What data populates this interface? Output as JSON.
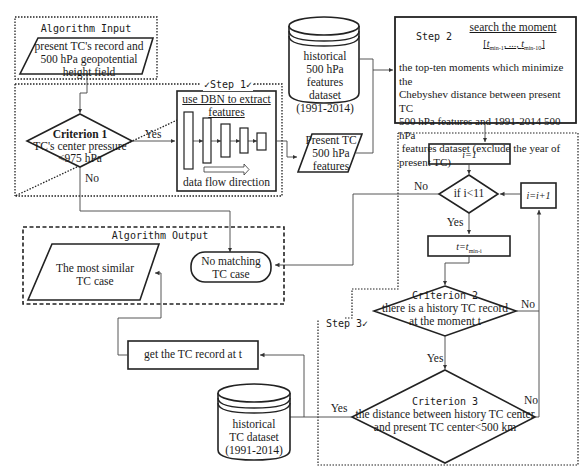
{
  "input_section": {
    "title": "Algorithm Input",
    "record": [
      "present TC's record and",
      "500 hPa geopotential",
      "height field"
    ]
  },
  "step1": {
    "label": "Step 1",
    "dbn_title": [
      "use DBN to extract",
      "features"
    ],
    "flow_label": "data flow direction"
  },
  "criterion1": {
    "title": "Criterion 1",
    "line1": "TC's center pressure",
    "line2": "<975 hPa",
    "yes_label": "Yes",
    "no_label": "No"
  },
  "features_dataset": [
    "historical",
    "500 hPa features",
    "dataset",
    "(1991-2014)"
  ],
  "present_features": [
    "Present TC",
    "500 hPa",
    "features"
  ],
  "step2": {
    "label": "Step 2",
    "title": "search the moment",
    "moment_set": "[t_min-1, ..., t_min-10]",
    "moment_open": "[",
    "moment_t1": "t",
    "moment_sub1": "min-1",
    "moment_mid": ", ..., ",
    "moment_t2": "t",
    "moment_sub2": "min-10",
    "moment_close": "]",
    "description": [
      "the top-ten moments which minimize the",
      "Chebyshev distance between present TC",
      "500 hPa features and 1991-2014 500 hPa",
      " features dataset (exclude the year of",
      "present TC)"
    ]
  },
  "step3": {
    "label": "Step 3",
    "init": "i=1",
    "loop_condition": "if i<11",
    "loop_no": "No",
    "loop_yes": "Yes",
    "increment": "i=i+1",
    "assign": "t=t_min-i",
    "assign_t": "t=t",
    "assign_sub": "min-i",
    "criterion2": {
      "title": "Criterion 2",
      "line1": "there is a history TC record",
      "line2": "at the moment t",
      "yes_label": "Yes",
      "no_label": "No"
    },
    "criterion3": {
      "title": "Criterion 3",
      "line1": "the distance between history TC center",
      "line2": "and present TC center<500 km",
      "yes_label": "Yes",
      "no_label": "No"
    }
  },
  "output_section": {
    "title": "Algorithm Output",
    "most_similar": [
      "The most similar",
      "TC case"
    ],
    "no_matching": [
      "No matching",
      "TC case"
    ]
  },
  "get_record": "get the TC record at t",
  "tc_dataset": [
    "historical",
    "TC dataset",
    "(1991-2014)"
  ]
}
